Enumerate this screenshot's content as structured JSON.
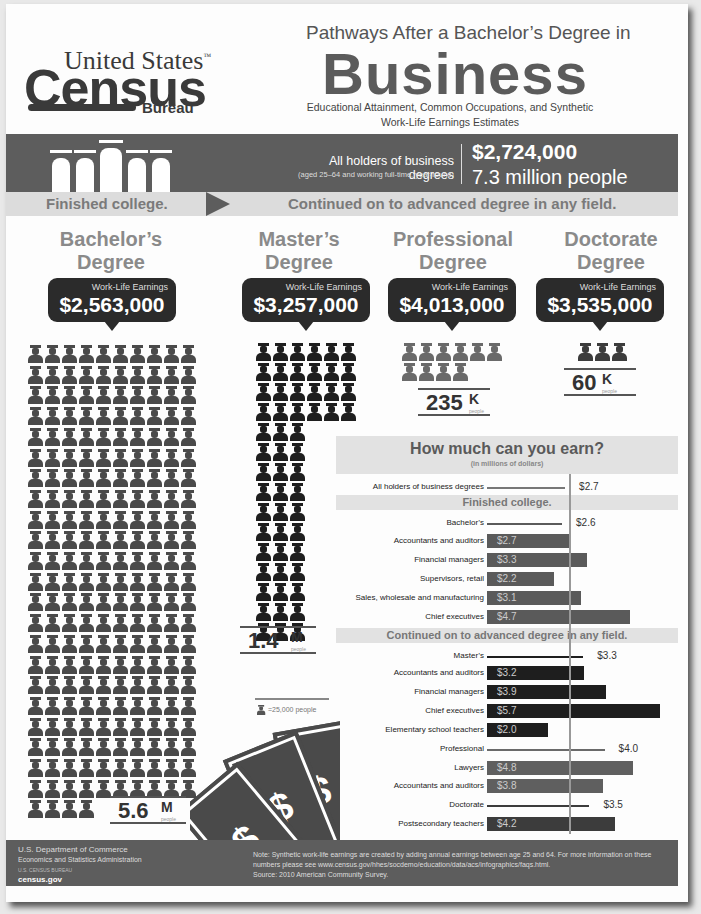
{
  "header": {
    "logo": {
      "line1": "United States",
      "tm": "™",
      "line2": "Census",
      "line3": "Bureau"
    },
    "title_pre": "Pathways After a Bachelor’s Degree in",
    "title_main": "Business",
    "subtitle": "Educational Attainment, Common Occupations, and Synthetic Work-Life Earnings Estimates"
  },
  "summary_band": {
    "label": "All holders of business degrees",
    "sublabel": "(aged 25–64 and working full-time, year-round)",
    "earnings": "$2,724,000",
    "people": "7.3 million people"
  },
  "path_strip": {
    "left": "Finished college.",
    "right": "Continued on to advanced degree in any field."
  },
  "degrees": [
    {
      "title_line1": "Bachelor’s",
      "title_line2": "Degree",
      "earnings_label": "Work-Life Earnings",
      "earnings": "$2,563,000",
      "count": "5.6",
      "unit": "M",
      "unit_sub": "people",
      "icons": 224,
      "color": "#4a4a4a"
    },
    {
      "title_line1": "Master’s",
      "title_line2": "Degree",
      "earnings_label": "Work-Life Earnings",
      "earnings": "$3,257,000",
      "count": "1.4",
      "unit": "M",
      "unit_sub": "people",
      "icons": 57,
      "color": "#1e1e1e"
    },
    {
      "title_line1": "Professional",
      "title_line2": "Degree",
      "earnings_label": "Work-Life Earnings",
      "earnings": "$4,013,000",
      "count": "235",
      "unit": "K",
      "unit_sub": "people",
      "icons": 10,
      "color": "#6a6a6a"
    },
    {
      "title_line1": "Doctorate",
      "title_line2": "Degree",
      "earnings_label": "Work-Life Earnings",
      "earnings": "$3,535,000",
      "count": "60",
      "unit": "K",
      "unit_sub": "people",
      "icons": 3,
      "color": "#3c3c3c"
    }
  ],
  "icon_legend": "=25,000 people",
  "chart_data": {
    "type": "bar",
    "title": "How much can you earn?",
    "subtitle": "(in millions of dollars)",
    "reference_value": 2.7,
    "xlim": [
      0,
      5.7
    ],
    "rows": [
      {
        "kind": "line",
        "label": "All holders of business degrees",
        "value": 2.7,
        "display": "$2.7",
        "color": "#777777"
      },
      {
        "kind": "header",
        "label": "Finished college."
      },
      {
        "kind": "line",
        "label": "Bachelor’s",
        "value": 2.6,
        "display": "$2.6",
        "color": "#5a5a5a"
      },
      {
        "kind": "bar",
        "label": "Accountants and auditors",
        "value": 2.7,
        "display": "$2.7",
        "color": "#5a5a5a"
      },
      {
        "kind": "bar",
        "label": "Financial managers",
        "value": 3.3,
        "display": "$3.3",
        "color": "#5a5a5a"
      },
      {
        "kind": "bar",
        "label": "Supervisors, retail",
        "value": 2.2,
        "display": "$2.2",
        "color": "#5a5a5a"
      },
      {
        "kind": "bar",
        "label": "Sales, wholesale and manufacturing",
        "value": 3.1,
        "display": "$3.1",
        "color": "#5a5a5a"
      },
      {
        "kind": "bar",
        "label": "Chief executives",
        "value": 4.7,
        "display": "$4.7",
        "color": "#5a5a5a"
      },
      {
        "kind": "header",
        "label": "Continued on to advanced degree in any field."
      },
      {
        "kind": "line",
        "label": "Master’s",
        "value": 3.3,
        "display": "$3.3",
        "color": "#1e1e1e"
      },
      {
        "kind": "bar",
        "label": "Accountants and auditors",
        "value": 3.2,
        "display": "$3.2",
        "color": "#1e1e1e"
      },
      {
        "kind": "bar",
        "label": "Financial managers",
        "value": 3.9,
        "display": "$3.9",
        "color": "#1e1e1e"
      },
      {
        "kind": "bar",
        "label": "Chief executives",
        "value": 5.7,
        "display": "$5.7",
        "color": "#1e1e1e"
      },
      {
        "kind": "bar",
        "label": "Elementary school teachers",
        "value": 2.0,
        "display": "$2.0",
        "color": "#1e1e1e"
      },
      {
        "kind": "line",
        "label": "Professional",
        "value": 4.0,
        "display": "$4.0",
        "color": "#6a6a6a"
      },
      {
        "kind": "bar",
        "label": "Lawyers",
        "value": 4.8,
        "display": "$4.8",
        "color": "#5f5f5f"
      },
      {
        "kind": "bar",
        "label": "Accountants and auditors",
        "value": 3.8,
        "display": "$3.8",
        "color": "#5f5f5f"
      },
      {
        "kind": "line",
        "label": "Doctorate",
        "value": 3.5,
        "display": "$3.5",
        "color": "#3c3c3c"
      },
      {
        "kind": "bar",
        "label": "Postsecondary teachers",
        "value": 4.2,
        "display": "$4.2",
        "color": "#3c3c3c"
      }
    ]
  },
  "footer": {
    "dept": "U.S. Department of Commerce",
    "admin": "Economics and Statistics Administration",
    "bureau": "U.S. CENSUS BUREAU",
    "site": "census.gov",
    "note": "Note: Synthetic work-life earnings are created by adding annual earnings between age 25 and 64. For more information on these numbers please see www.census.gov/hhes/socdemo/education/data/acs/infographics/faqs.html.",
    "source": "Source: 2010 American Community Survey."
  }
}
